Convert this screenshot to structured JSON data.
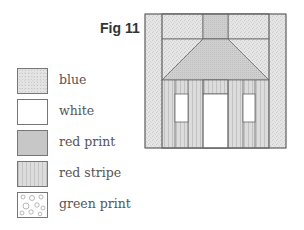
{
  "figure": {
    "title": "Fig 11"
  },
  "legend": {
    "items": [
      {
        "label": "blue",
        "pattern": "speckled light gray",
        "color": "#e4e4e4"
      },
      {
        "label": "white",
        "pattern": "plain",
        "color": "#ffffff"
      },
      {
        "label": "red print",
        "pattern": "fine dots medium gray",
        "color": "#cfcfcf"
      },
      {
        "label": "red stripe",
        "pattern": "vertical stripes",
        "color": "#dcdcdc"
      },
      {
        "label": "green print",
        "pattern": "circle scribble print",
        "color": "#ffffff"
      }
    ]
  },
  "block": {
    "fabrics": {
      "background": "blue",
      "chimney": "red print",
      "roof": "red print",
      "walls": "red stripe",
      "windows": "white",
      "door": "white"
    }
  }
}
